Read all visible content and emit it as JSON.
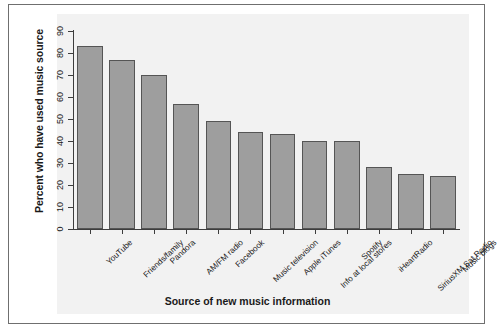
{
  "chart_data": {
    "type": "bar",
    "title": "",
    "xlabel": "Source of new music information",
    "ylabel": "Percent who have used music source",
    "categories": [
      "YouTube",
      "Friends/family",
      "Pandora",
      "AM/FM radio",
      "Facebook",
      "Music television",
      "Apple iTunes",
      "Info at local stores",
      "Spotify",
      "iHeartRadio",
      "SiriusXM Sat Radio",
      "Music blogs"
    ],
    "values": [
      83,
      77,
      70,
      57,
      49,
      44,
      43,
      40,
      40,
      28,
      25,
      24
    ],
    "ylim": [
      0,
      90
    ],
    "ytick_labels": [
      "0",
      "10",
      "20",
      "30",
      "40",
      "50",
      "60",
      "70",
      "80",
      "90"
    ],
    "ytick_values": [
      0,
      10,
      20,
      30,
      40,
      50,
      60,
      70,
      80,
      90
    ],
    "grid": false,
    "legend": null,
    "bar_color": "#9e9e9e",
    "bar_edge_color": "#555555",
    "axis_color": "#3d3d3d",
    "text_color": "#1a1a1a",
    "background": "#ffffff",
    "frame_border_color": "#6f6f6f"
  }
}
